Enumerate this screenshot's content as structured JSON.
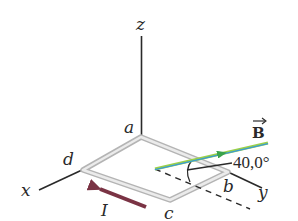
{
  "diagram": {
    "axes": {
      "x_label": "x",
      "y_label": "y",
      "z_label": "z"
    },
    "loop": {
      "corners": {
        "a": "a",
        "b": "b",
        "c": "c",
        "d": "d"
      },
      "color": "#c8c8c8"
    },
    "field": {
      "label": "B",
      "angle_label": "40,0°",
      "color_outer": "#9bd04a",
      "color_inner": "#3a9bd6"
    },
    "current": {
      "label": "I",
      "color": "#7a3344"
    },
    "colors": {
      "axis": "#2a2a2a",
      "dashed": "#2a2a2a"
    }
  }
}
